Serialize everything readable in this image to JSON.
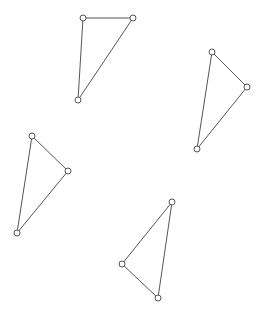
{
  "canvas": {
    "width": 261,
    "height": 311,
    "background": "#ffffff",
    "stroke_color": "#555555",
    "vertex_radius": 3
  },
  "triangles": [
    {
      "id": "triangle-1",
      "vertices": [
        [
          83,
          18
        ],
        [
          133,
          18
        ],
        [
          78,
          100
        ]
      ]
    },
    {
      "id": "triangle-2",
      "vertices": [
        [
          212,
          52
        ],
        [
          247,
          87
        ],
        [
          197,
          149
        ]
      ]
    },
    {
      "id": "triangle-3",
      "vertices": [
        [
          32,
          136
        ],
        [
          68,
          171
        ],
        [
          17,
          233
        ]
      ]
    },
    {
      "id": "triangle-4",
      "vertices": [
        [
          172,
          202
        ],
        [
          122,
          264
        ],
        [
          158,
          298
        ]
      ]
    }
  ]
}
